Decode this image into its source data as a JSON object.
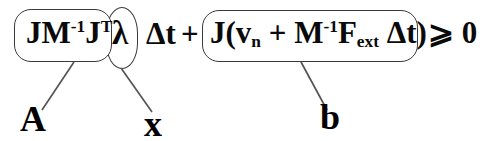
{
  "figure": {
    "kind": "annotated-equation",
    "background_color": "#ffffff",
    "ink_color": "#0a0a0a",
    "box_stroke_color": "#3a3a3a",
    "leader_color": "#555555"
  },
  "equation": {
    "full_text": "JM^-1 J^T λ Δt + J(v_n + M^-1 F_ext Δt) ⩾ 0",
    "terms": {
      "matrix_A": {
        "label": "A",
        "parts": {
          "j": "J",
          "m": "M",
          "m_exponent": "-1",
          "j2": "J",
          "j2_exponent": "T"
        }
      },
      "unknown_x": {
        "label": "x",
        "symbol": "λ"
      },
      "timestep": {
        "delta": "Δ",
        "t": "t"
      },
      "operator_plus": "+",
      "vector_b": {
        "label": "b",
        "parts": {
          "j": "J",
          "open_paren": "(",
          "v": "v",
          "v_subscript": "n",
          "inner_plus": "+",
          "m": "M",
          "m_exponent": "-1",
          "f": "F",
          "f_subscript": "ext",
          "delta": "Δ",
          "t": "t",
          "close_paren": ")"
        }
      },
      "relation": {
        "operator": "⩾",
        "right_hand_side": "0"
      }
    }
  },
  "annotations": [
    {
      "name": "A",
      "text": "A",
      "points_to": "matrix-group-box"
    },
    {
      "name": "x",
      "text": "x",
      "points_to": "lambda-group-box"
    },
    {
      "name": "b",
      "text": "b",
      "points_to": "rhs-group-box"
    }
  ]
}
